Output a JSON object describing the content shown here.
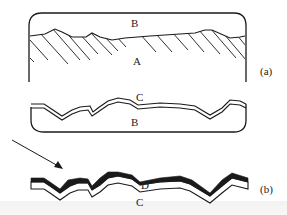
{
  "figure": {
    "panel_a": {
      "id_label": "(a)",
      "labels": {
        "upper_region": "B",
        "lower_region": "A"
      }
    },
    "panel_a_lower": {
      "labels": {
        "film": "C",
        "substrate": "B"
      }
    },
    "panel_b": {
      "id_label": "(b)",
      "labels": {
        "coating": "D",
        "film": "C"
      }
    },
    "arrow": {
      "direction": "down-right"
    },
    "colors": {
      "line": "#1a1a1a",
      "background": "#ffffff",
      "coating_fill": "#1a1a1a"
    }
  }
}
